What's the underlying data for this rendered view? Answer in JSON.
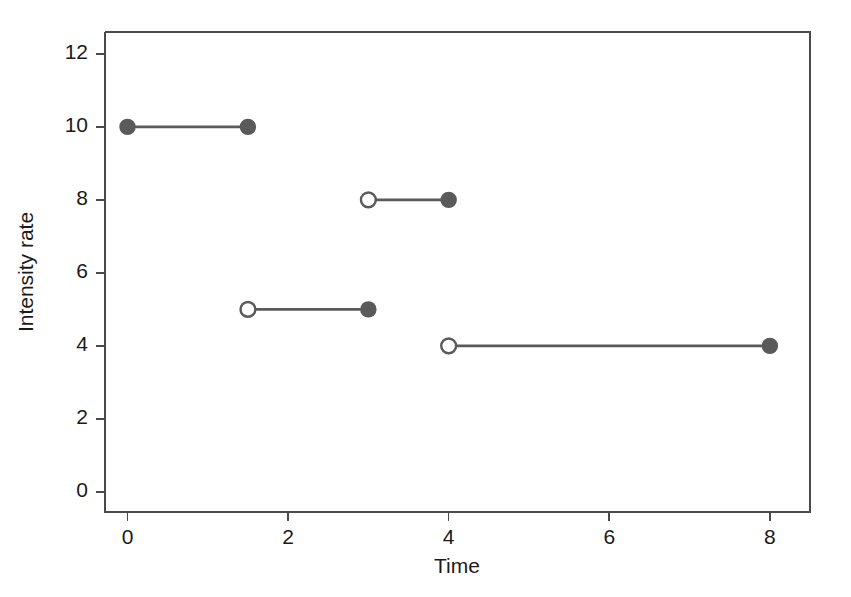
{
  "chart_data": {
    "type": "line",
    "subtype": "step-function-segments",
    "title": "",
    "xlabel": "Time",
    "ylabel": "Intensity rate",
    "xlim": [
      -0.28,
      8.5
    ],
    "ylim": [
      -0.55,
      12.6
    ],
    "xticks": [
      0,
      2,
      4,
      6,
      8
    ],
    "xticklabels": [
      "0",
      "2",
      "4",
      "6",
      "8"
    ],
    "yticks": [
      0,
      2,
      4,
      6,
      8,
      10,
      12
    ],
    "yticklabels": [
      "0",
      "2",
      "4",
      "6",
      "8",
      "10",
      "12"
    ],
    "grid": false,
    "legend": null,
    "colors": {
      "line": "#5a5a5a",
      "marker_fill": "#5a5a5a",
      "marker_open_fill": "#ffffff",
      "marker_edge": "#5a5a5a",
      "axis": "#4a4a4a",
      "background": "#ffffff",
      "text": "#1a1a1a"
    },
    "segments": [
      {
        "name": "segment-1",
        "y": 10,
        "x_start": 0,
        "x_end": 1.5,
        "left_marker": "closed",
        "right_marker": "closed"
      },
      {
        "name": "segment-2",
        "y": 5,
        "x_start": 1.5,
        "x_end": 3,
        "left_marker": "open",
        "right_marker": "closed"
      },
      {
        "name": "segment-3",
        "y": 8,
        "x_start": 3,
        "x_end": 4,
        "left_marker": "open",
        "right_marker": "closed"
      },
      {
        "name": "segment-4",
        "y": 4,
        "x_start": 4,
        "x_end": 8,
        "left_marker": "open",
        "right_marker": "closed"
      }
    ]
  }
}
